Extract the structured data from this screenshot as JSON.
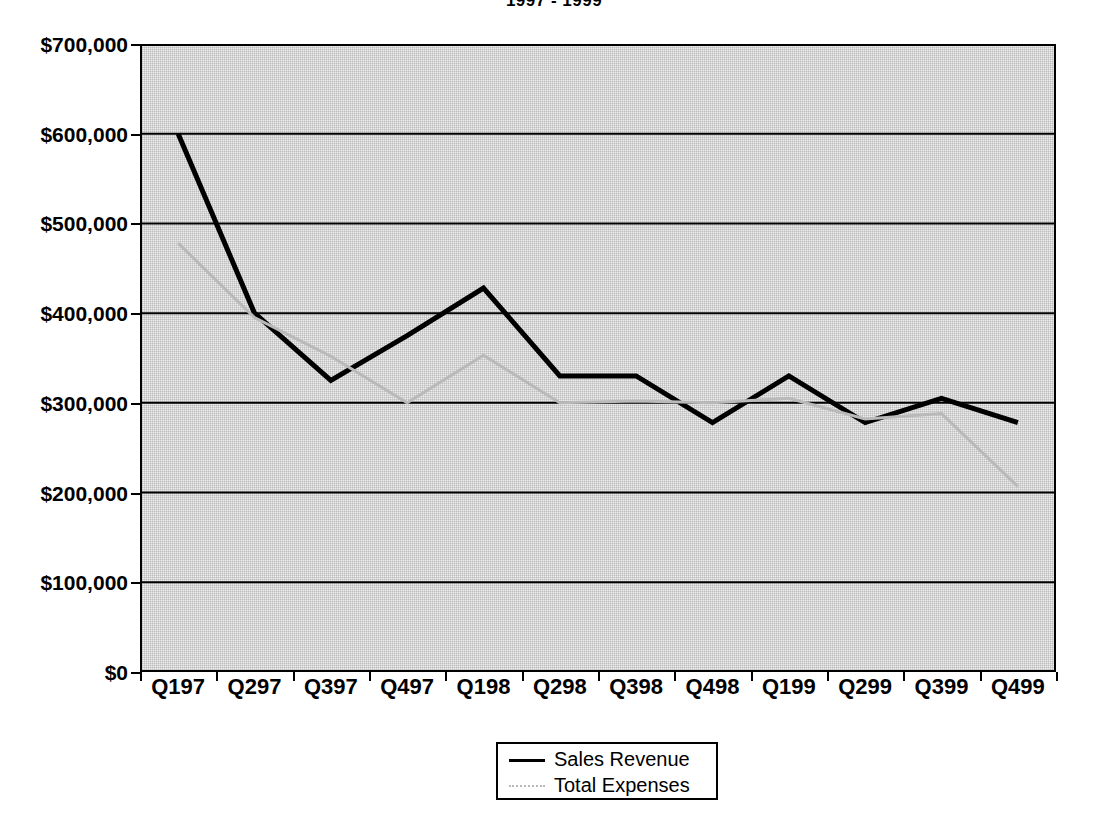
{
  "chart_data": {
    "type": "line",
    "title": "1997 - 1999",
    "xlabel": "",
    "ylabel": "",
    "categories": [
      "Q197",
      "Q297",
      "Q397",
      "Q497",
      "Q198",
      "Q298",
      "Q398",
      "Q498",
      "Q199",
      "Q299",
      "Q399",
      "Q499"
    ],
    "series": [
      {
        "name": "Sales Revenue",
        "style": "solid-black",
        "values": [
          600000,
          400000,
          325000,
          375000,
          428000,
          330000,
          330000,
          278000,
          330000,
          278000,
          305000,
          278000
        ]
      },
      {
        "name": "Total Expenses",
        "style": "faint-gray",
        "values": [
          478000,
          395000,
          352000,
          300000,
          353000,
          300000,
          302000,
          300000,
          305000,
          282000,
          288000,
          207000
        ]
      }
    ],
    "ylim": [
      0,
      700000
    ],
    "ytick_values": [
      0,
      100000,
      200000,
      300000,
      400000,
      500000,
      600000,
      700000
    ],
    "ytick_labels": [
      "$0",
      "$100,000",
      "$200,000",
      "$300,000",
      "$400,000",
      "$500,000",
      "$600,000",
      "$700,000"
    ],
    "grid": "horizontal",
    "legend_position": "bottom-center",
    "colors": {
      "sales_revenue_line": "#000000",
      "total_expenses_line": "#b9b9b9",
      "plot_background": "#ececec",
      "axis": "#000000",
      "page_background": "#ffffff"
    }
  }
}
